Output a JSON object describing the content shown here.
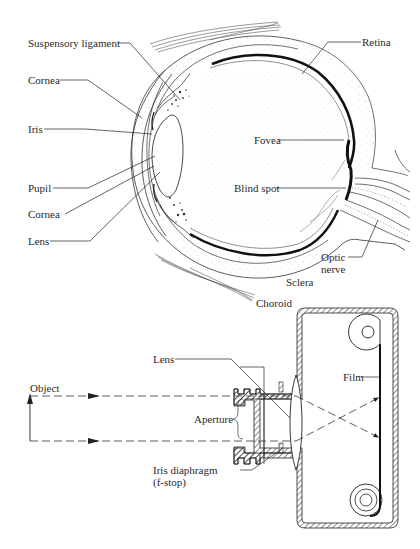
{
  "eye_diagram": {
    "labels": {
      "suspensory_ligament": "Suspensory ligament",
      "cornea_top": "Cornea",
      "iris": "Iris",
      "pupil": "Pupil",
      "cornea_bottom": "Cornea",
      "lens": "Lens",
      "retina": "Retina",
      "fovea": "Fovea",
      "blind_spot": "Blind spot",
      "optic_nerve_line1": "Optic",
      "optic_nerve_line2": "nerve",
      "sclera": "Sclera",
      "choroid": "Choroid"
    }
  },
  "camera_diagram": {
    "labels": {
      "lens": "Lens",
      "object": "Object",
      "aperture": "Aperture",
      "iris_diaphragm_line1": "Iris diaphragm",
      "iris_diaphragm_line2": "(f-stop)",
      "film": "Film"
    }
  },
  "colors": {
    "ink": "#2a2a2a",
    "background": "#ffffff"
  }
}
